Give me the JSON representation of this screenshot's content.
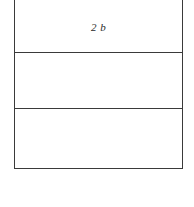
{
  "figure": {
    "kind": "divided-rectangle-diagram",
    "background_color": "#ffffff",
    "stroke_color": "#3a3a3a",
    "stroke_width_px": 1.5,
    "canvas": {
      "width_px": 194,
      "height_px": 207
    },
    "outline": {
      "name": "outer-rectangle",
      "top_edge_visible": false,
      "left_px": 14,
      "right_px": 183,
      "bottom_px": 168
    },
    "dividers": [
      {
        "name": "divider-1",
        "y_px": 52
      },
      {
        "name": "divider-2",
        "y_px": 108
      }
    ],
    "bands": [
      {
        "name": "top-band",
        "label": "2 b",
        "label_style": "italic",
        "top_px": 0,
        "bottom_px": 52
      },
      {
        "name": "middle-band",
        "label": "",
        "label_style": "italic",
        "top_px": 52,
        "bottom_px": 108
      },
      {
        "name": "bottom-band",
        "label": "",
        "label_style": "italic",
        "top_px": 108,
        "bottom_px": 168
      }
    ]
  }
}
